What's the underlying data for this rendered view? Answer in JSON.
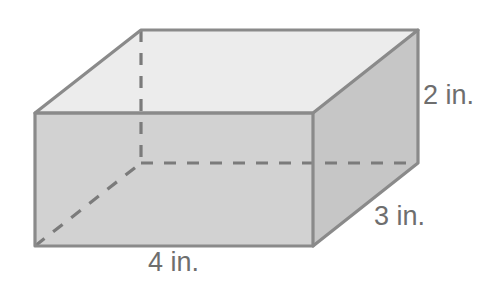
{
  "figure": {
    "kind": "rectangular-prism-diagram",
    "background_color": "#ffffff"
  },
  "labels": {
    "height": "2 in.",
    "depth": "3 in.",
    "width": "4 in.",
    "text_color": "#6e6e6e"
  },
  "solid": {
    "faces": {
      "top": {
        "name": "top-face",
        "fill": "#ececec",
        "points": "35,113 141,30 418,30 313,113"
      },
      "front": {
        "name": "front-face",
        "fill": "#d2d2d2",
        "points": "35,113 313,113 313,246 35,246"
      },
      "right": {
        "name": "right-face",
        "fill": "#c6c6c6",
        "points": "313,113 418,30 418,163 313,246"
      }
    },
    "edges": {
      "stroke": "#8a8a8a",
      "stroke_width": 3.2,
      "visible": [
        "35,113 313,113",
        "313,113 313,246",
        "313,246 35,246",
        "35,246 35,113",
        "35,113 141,30",
        "141,30 418,30",
        "418,30 313,113",
        "418,30 418,163",
        "418,163 313,246"
      ]
    },
    "hidden_edges": {
      "stroke": "#7b7b7b",
      "stroke_width": 3.2,
      "dash": "12 11",
      "segments": [
        "141,30 141,163",
        "141,163 418,163",
        "35,246 141,163"
      ]
    }
  },
  "dimensions": {
    "width_in": 4,
    "depth_in": 3,
    "height_in": 2,
    "unit": "in."
  }
}
